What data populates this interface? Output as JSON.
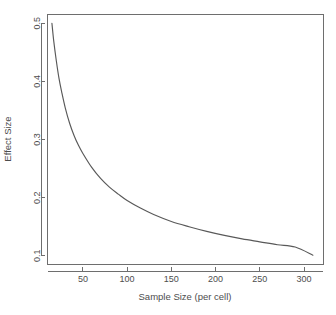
{
  "chart_data": {
    "type": "line",
    "title": "",
    "xlabel": "Sample Size (per cell)",
    "ylabel": "Effect Size",
    "xlim": [
      10,
      322
    ],
    "ylim": [
      0.085,
      0.515
    ],
    "xticks": [
      50,
      100,
      150,
      200,
      250,
      300
    ],
    "xtick_labels": [
      "50",
      "100",
      "150",
      "200",
      "250",
      "300"
    ],
    "yticks": [
      0.1,
      0.2,
      0.3,
      0.4,
      0.5
    ],
    "ytick_labels": [
      "0.1",
      "0.2",
      "0.3",
      "0.4",
      "0.5"
    ],
    "grid": false,
    "legend": null,
    "series": [
      {
        "name": "Minimum Detectable Effect Size",
        "color": "#595959",
        "x": [
          15,
          17,
          20,
          23,
          26,
          30,
          35,
          40,
          45,
          50,
          60,
          70,
          80,
          90,
          100,
          115,
          130,
          150,
          170,
          190,
          210,
          230,
          250,
          270,
          290,
          310
        ],
        "y": [
          0.5,
          0.47,
          0.435,
          0.405,
          0.382,
          0.355,
          0.328,
          0.307,
          0.29,
          0.276,
          0.252,
          0.233,
          0.218,
          0.206,
          0.195,
          0.182,
          0.171,
          0.159,
          0.15,
          0.142,
          0.135,
          0.129,
          0.124,
          0.119,
          0.115,
          0.101
        ]
      }
    ],
    "annotations": []
  },
  "axes": {
    "y_axis_label": "Effect Size",
    "x_axis_label": "Sample Size (per cell)"
  },
  "colors": {
    "curve": "#595959",
    "axis": "#6e6e6e",
    "text": "#4d4d4d",
    "background": "#ffffff"
  }
}
